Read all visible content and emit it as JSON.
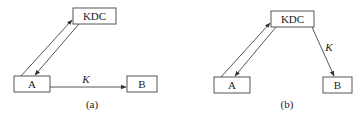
{
  "diagram_a": {
    "kdc_label": "KDC",
    "a_label": "A",
    "b_label": "B",
    "key_label": "K",
    "caption": "(a)"
  },
  "diagram_b": {
    "kdc_label": "KDC",
    "a_label": "A",
    "b_label": "B",
    "key_label": "K",
    "caption": "(b)"
  }
}
